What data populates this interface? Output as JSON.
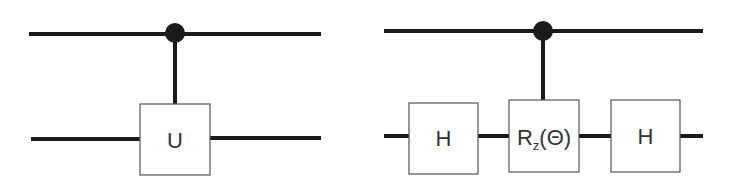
{
  "diagram": {
    "left_circuit": {
      "gates": [
        {
          "label": "U"
        }
      ],
      "control": "filled-dot"
    },
    "right_circuit": {
      "gates": [
        {
          "label": "H"
        },
        {
          "label": "R",
          "subscript": "z",
          "argument": "(Θ)"
        },
        {
          "label": "H"
        }
      ],
      "control": "filled-dot"
    }
  }
}
